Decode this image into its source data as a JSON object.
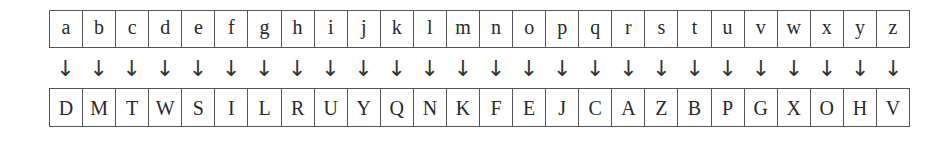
{
  "cipher_table": {
    "plaintext": [
      "a",
      "b",
      "c",
      "d",
      "e",
      "f",
      "g",
      "h",
      "i",
      "j",
      "k",
      "l",
      "m",
      "n",
      "o",
      "p",
      "q",
      "r",
      "s",
      "t",
      "u",
      "v",
      "w",
      "x",
      "y",
      "z"
    ],
    "arrow_glyph": "↓",
    "ciphertext": [
      "D",
      "M",
      "T",
      "W",
      "S",
      "I",
      "L",
      "R",
      "U",
      "Y",
      "Q",
      "N",
      "K",
      "F",
      "E",
      "J",
      "C",
      "A",
      "Z",
      "B",
      "P",
      "G",
      "X",
      "O",
      "H",
      "V"
    ]
  }
}
